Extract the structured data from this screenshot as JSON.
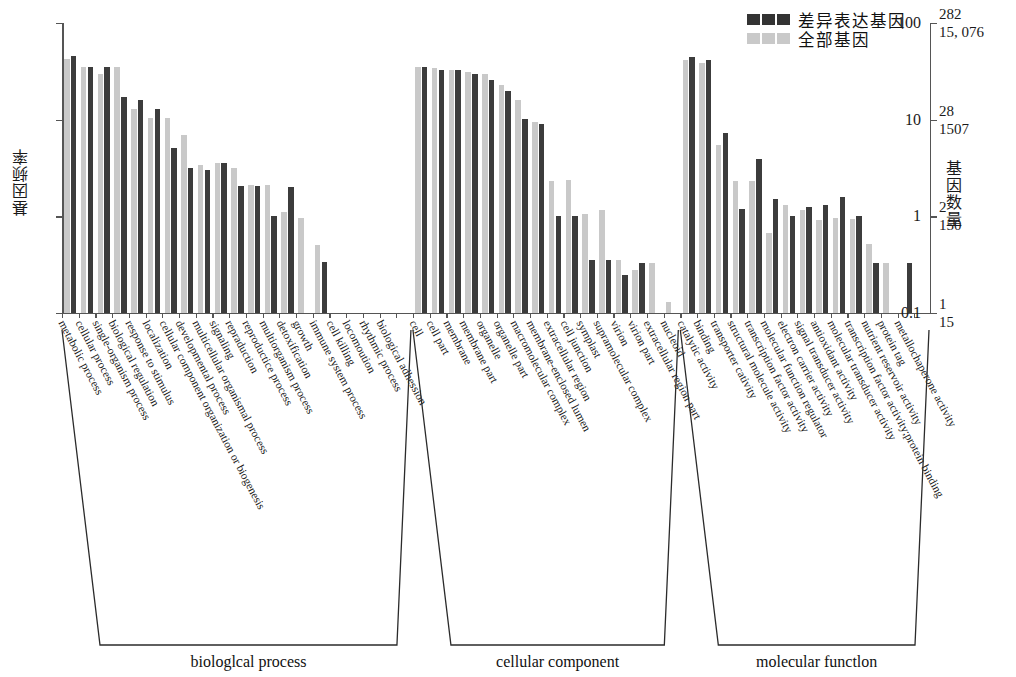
{
  "chart_data": {
    "type": "bar",
    "title": "",
    "log_scale": true,
    "ylabel": "基因频率",
    "ylabel_right": "基因数量",
    "ylim": [
      0.1,
      100
    ],
    "yticks": [
      "100",
      "10",
      "1",
      "0.1"
    ],
    "yticks_right": [
      {
        "top": "282",
        "bottom": "15, 076"
      },
      {
        "top": "28",
        "bottom": "1507"
      },
      {
        "top": "2",
        "bottom": "150"
      },
      {
        "top": "1",
        "bottom": "15"
      }
    ],
    "legend": [
      {
        "name": "差异表达基因",
        "color": "#333333"
      },
      {
        "name": "全部基因",
        "color": "#c9c9c9"
      }
    ],
    "series": [
      {
        "name": "全部基因",
        "color": "#c9c9c9"
      },
      {
        "name": "差异表达基因",
        "color": "#3c3c3c"
      }
    ],
    "sections": [
      {
        "label": "biologlcal process",
        "start": 0,
        "end": 21
      },
      {
        "label": "cellular component",
        "start": 21,
        "end": 37
      },
      {
        "label": "molecular functlon",
        "start": 37,
        "end": 52
      }
    ],
    "categories": [
      "metabolic process",
      "cellular process",
      "single-organism process",
      "biological regulation",
      "response to stimulus",
      "localization",
      "cellular component organization or biogenesis",
      "developmental process",
      "multicellular organismal process",
      "signaling",
      "repraduction",
      "reproductice process",
      "multiorganism process",
      "detoxification",
      "growth",
      "immune system process",
      "cell killing",
      "locomoution",
      "rhythmic process",
      "biological adhession",
      "",
      "cell",
      "cell part",
      "membrane",
      "membrane part",
      "organelle",
      "organelle part",
      "macromolecular complex",
      "membrane-enclosed lumen",
      "extracellular region",
      "cell junction",
      "symplast",
      "supramolecular complex",
      "virion",
      "virion part",
      "extracellular region part",
      "nucleoid",
      "catalytic activity",
      "binding",
      "transporter cativity",
      "structural molecule activity",
      "transcription factor activity",
      "molecular function regulator",
      "electron carrier activity",
      "signal transducer activity",
      "antioxidant activity",
      "molecular transducer activity",
      "transcription factor activity;protein binding",
      "nutrient reservoir activity",
      "protein tag",
      "metallochaperone activity",
      ""
    ],
    "values_all_genes": [
      42,
      35,
      30,
      35,
      13,
      10.3,
      10.3,
      7.0,
      3.4,
      3.6,
      3.2,
      2.1,
      2.1,
      1.1,
      0.97,
      0.5,
      0,
      0,
      0,
      0,
      0,
      35,
      34,
      33,
      31,
      30,
      23,
      16,
      9.5,
      2.3,
      2.4,
      1.05,
      1.15,
      0.35,
      0.28,
      0.33,
      0.13,
      41,
      39,
      5.5,
      2.3,
      2.3,
      0.67,
      1.3,
      1.15,
      0.92,
      0.96,
      0.95,
      0.52,
      0.33,
      0,
      0
    ],
    "values_deg": [
      46,
      35,
      35,
      17,
      16,
      13,
      5.1,
      3.2,
      3.0,
      3.6,
      2.05,
      2.05,
      1.0,
      2.0,
      0,
      0.34,
      0,
      0,
      0,
      0,
      0,
      35,
      33,
      33,
      30,
      26,
      20,
      10.2,
      9.0,
      1.0,
      1.0,
      0.35,
      0.35,
      0.25,
      0.33,
      0,
      0,
      44,
      41,
      7.3,
      1.2,
      3.9,
      1.5,
      1.0,
      1.25,
      1.3,
      1.6,
      1.0,
      0.33,
      0,
      0.33,
      0
    ]
  }
}
